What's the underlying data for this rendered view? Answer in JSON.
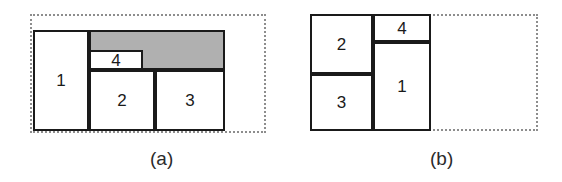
{
  "figure": {
    "width": 562,
    "height": 182,
    "background": "#ffffff",
    "line_color": "#1a1a1a",
    "dotted_color": "#8d8d8d",
    "shade_color": "#b0b0b0"
  },
  "panels": [
    {
      "id": "a",
      "caption": "(a)",
      "caption_x": 150,
      "caption_y": 148,
      "container": {
        "x": 30,
        "y": 14,
        "w": 236,
        "h": 119
      },
      "packed": {
        "x": 33,
        "y": 30,
        "w": 192,
        "h": 101
      },
      "shaded_regions": [
        {
          "name": "free-space-shaded",
          "x": 89,
          "y": 30,
          "w": 136,
          "h": 40
        }
      ],
      "cells": [
        {
          "label": "1",
          "x": 33,
          "y": 30,
          "w": 56,
          "h": 101,
          "shaded": false
        },
        {
          "label": "4",
          "x": 89,
          "y": 50,
          "w": 54,
          "h": 20,
          "shaded": false
        },
        {
          "label": "2",
          "x": 89,
          "y": 70,
          "w": 66,
          "h": 61,
          "shaded": false
        },
        {
          "label": "3",
          "x": 155,
          "y": 70,
          "w": 70,
          "h": 61,
          "shaded": false
        }
      ]
    },
    {
      "id": "b",
      "caption": "(b)",
      "caption_x": 430,
      "caption_y": 148,
      "container": {
        "x": 310,
        "y": 14,
        "w": 228,
        "h": 117
      },
      "packed": {
        "x": 310,
        "y": 14,
        "w": 121,
        "h": 117
      },
      "shaded_regions": [],
      "cells": [
        {
          "label": "2",
          "x": 310,
          "y": 14,
          "w": 63,
          "h": 60,
          "shaded": false
        },
        {
          "label": "3",
          "x": 310,
          "y": 74,
          "w": 63,
          "h": 57,
          "shaded": false
        },
        {
          "label": "4",
          "x": 373,
          "y": 14,
          "w": 58,
          "h": 28,
          "shaded": false
        },
        {
          "label": "1",
          "x": 373,
          "y": 42,
          "w": 58,
          "h": 89,
          "shaded": false
        }
      ]
    }
  ]
}
